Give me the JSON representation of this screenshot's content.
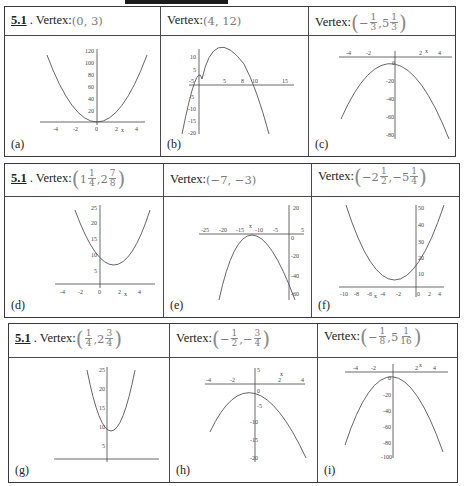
{
  "section_label": "5.1",
  "vertex_label": "Vertex:",
  "rows": [
    {
      "cells": [
        {
          "letter": "(a)",
          "show_section": true,
          "vertex": "(0, 3)"
        },
        {
          "letter": "(b)",
          "show_section": false,
          "vertex": "(4, 12)"
        },
        {
          "letter": "(c)",
          "show_section": false,
          "vertex": "(-1/3, 5 1/3)"
        }
      ]
    },
    {
      "cells": [
        {
          "letter": "(d)",
          "show_section": true,
          "vertex": "(1 1/4, 2 7/8)"
        },
        {
          "letter": "(e)",
          "show_section": false,
          "vertex": "(-7, -3)"
        },
        {
          "letter": "(f)",
          "show_section": false,
          "vertex": "(-2 1/2, -5 1/4)"
        }
      ]
    },
    {
      "cells": [
        {
          "letter": "(g)",
          "show_section": true,
          "vertex": "(1/4, 2 3/4)"
        },
        {
          "letter": "(h)",
          "show_section": false,
          "vertex": "(-1/2, -3/4)"
        },
        {
          "letter": "(i)",
          "show_section": false,
          "vertex": "(-1/8, 5 1/16)"
        }
      ]
    }
  ],
  "graphs": {
    "a": {
      "xticks": [
        "-4",
        "-2",
        "0",
        "2",
        "4"
      ],
      "yticks": [
        "20",
        "40",
        "60",
        "80",
        "100",
        "120"
      ],
      "axis_label": "x"
    },
    "b": {
      "xticks": [
        "-5",
        "5",
        "8",
        "10",
        "15"
      ],
      "yticks": [
        "10",
        "5",
        "-5",
        "-10",
        "-15",
        "-20"
      ],
      "axis_label": "x"
    },
    "c": {
      "xticks": [
        "-4",
        "-2",
        "2",
        "4"
      ],
      "yticks": [
        "0",
        "-20",
        "-40",
        "-60",
        "-80"
      ],
      "axis_label": "x"
    },
    "d": {
      "xticks": [
        "-4",
        "-2",
        "0",
        "2",
        "4"
      ],
      "yticks": [
        "5",
        "10",
        "15",
        "20",
        "25"
      ],
      "axis_label": "x"
    },
    "e": {
      "xticks": [
        "-25",
        "-20",
        "-15",
        "-10",
        "-5",
        "5"
      ],
      "yticks": [
        "20",
        "0",
        "-20",
        "-40",
        "-60"
      ],
      "axis_label": "x"
    },
    "f": {
      "xticks": [
        "-10",
        "-8",
        "-6",
        "-4",
        "-2",
        "0",
        "2",
        "4"
      ],
      "yticks": [
        "10",
        "20",
        "30",
        "40",
        "50"
      ],
      "axis_label": "x"
    },
    "g": {
      "xticks": [
        "-4",
        "-2",
        "0",
        "2",
        "4"
      ],
      "yticks": [
        "5",
        "10",
        "15",
        "20",
        "25"
      ],
      "axis_label": "x"
    },
    "h": {
      "xticks": [
        "-4",
        "-2",
        "2",
        "4"
      ],
      "yticks": [
        "5",
        "0",
        "-5",
        "-10",
        "-15",
        "-20"
      ],
      "axis_label": "x"
    },
    "i": {
      "xticks": [
        "-4",
        "-2",
        "2",
        "4"
      ],
      "yticks": [
        "0",
        "-20",
        "-40",
        "-60",
        "-80",
        "-100"
      ],
      "axis_label": "x"
    }
  }
}
